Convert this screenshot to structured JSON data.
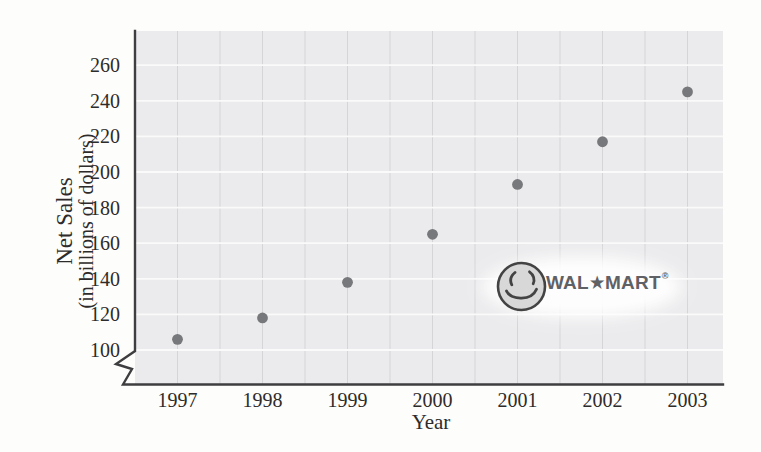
{
  "figure": {
    "y_axis_title_line1": "Net Sales",
    "y_axis_title_line2": "(in billions of dollars)",
    "x_axis_title": "Year"
  },
  "logo": {
    "brand_left": "WAL",
    "star": "★",
    "brand_right": "MART",
    "reg_mark": "®"
  },
  "colors": {
    "page_bg": "#fdfdfc",
    "plot_bg": "#ebebed",
    "h_grid": "#fafafa",
    "v_grid": "#d5d5d8",
    "axis": "#3e3e40",
    "dot": "#77787b",
    "tick_text": "#2e2c2a",
    "logo_text": "#606165",
    "smiley_fill": "#d8d8d8",
    "smiley_stroke": "#434343",
    "logo_glow": "#ffffff"
  },
  "chart_data": {
    "type": "scatter",
    "series_name": "Wal-Mart net sales",
    "x": [
      1997,
      1998,
      1999,
      2000,
      2001,
      2002,
      2003
    ],
    "values": [
      106,
      118,
      138,
      165,
      193,
      217,
      245
    ],
    "x_tick_labels": [
      "1997",
      "1998",
      "1999",
      "2000",
      "2001",
      "2002",
      "2003"
    ],
    "y_ticks": [
      100,
      120,
      140,
      160,
      180,
      200,
      220,
      240,
      260
    ],
    "xlabel": "Year",
    "ylabel": "Net Sales (in billions of dollars)",
    "xlim": [
      1996.5,
      2003.5
    ],
    "ylim": [
      100,
      260
    ],
    "axis_break_at_origin": true,
    "grid": "horizontal white major lines every 20; vertical gray lines every half year",
    "legend": "none"
  }
}
